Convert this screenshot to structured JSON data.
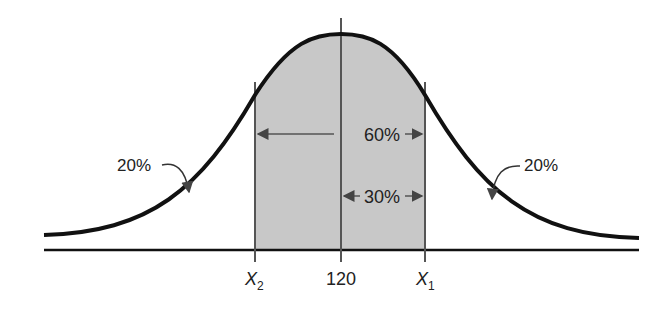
{
  "diagram": {
    "type": "normal-distribution",
    "mean_label": "120",
    "x_left_label": "X",
    "x_left_sub": "2",
    "x_right_label": "X",
    "x_right_sub": "1",
    "center_region_label": "60%",
    "half_region_label": "30%",
    "left_tail_label": "20%",
    "right_tail_label": "20%",
    "colors": {
      "curve": "#111111",
      "shade": "#c8c8c8",
      "lines": "#555555",
      "text": "#222222"
    }
  }
}
